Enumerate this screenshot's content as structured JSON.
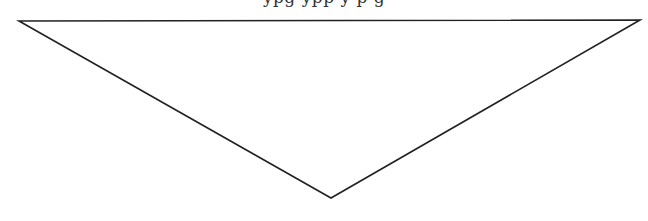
{
  "header": {
    "clipped_text": "ypg ypp y p g"
  },
  "diagram": {
    "shape": "inverted-triangle",
    "vertices": [
      {
        "x": 19,
        "y": 21
      },
      {
        "x": 640,
        "y": 20
      },
      {
        "x": 331,
        "y": 198
      }
    ],
    "stroke_color": "#222222",
    "fill_color": "#ffffff",
    "stroke_width": 1.6
  }
}
